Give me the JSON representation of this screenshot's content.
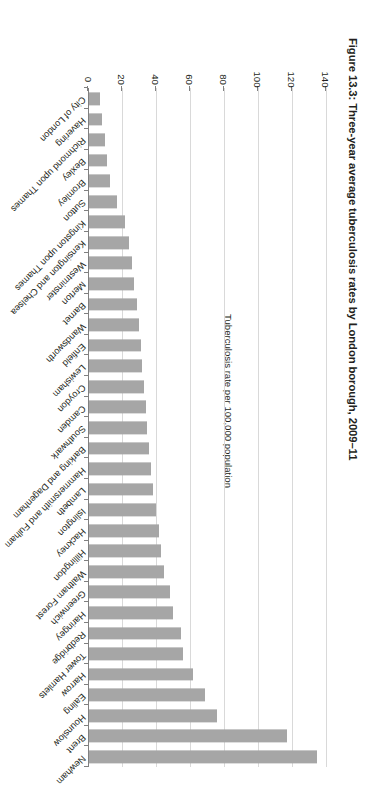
{
  "figure": {
    "caption": "Figure 13.3: Three-year average tuberculosis rates by London borough, 2009–11"
  },
  "colors": {
    "bar": "#a6a6a6",
    "gridline": "#d9d9d9",
    "axis": "#808080",
    "text": "#231f20",
    "background": "#ffffff"
  },
  "chart_data": {
    "type": "bar",
    "orientation": "vertical",
    "title": "Figure 13.3: Three-year average tuberculosis rates by London borough, 2009–11",
    "xlabel": "",
    "ylabel": "Tuberculosis rate per 100,000 population",
    "ylim": [
      0,
      140
    ],
    "yticks": [
      0,
      20,
      40,
      60,
      80,
      100,
      120,
      140
    ],
    "ytick_labels": [
      "0",
      "20",
      "40",
      "60",
      "80",
      "100",
      "120",
      "140"
    ],
    "grid": true,
    "legend": false,
    "series_name": "Three-year average tuberculosis rate",
    "categories": [
      "Newham",
      "Brent",
      "Hounslow",
      "Ealing",
      "Harrow",
      "Tower Hamlets",
      "Redbridge",
      "Haringey",
      "Greenwich",
      "Waltham Forest",
      "Hillingdon",
      "Hackney",
      "Islington",
      "Lambeth",
      "Hammersmith and Fulham",
      "Barking and Dagenham",
      "Southwark",
      "Camden",
      "Croydon",
      "Lewisham",
      "Enfield",
      "Wandsworth",
      "Barnet",
      "Merton",
      "Westminster",
      "Kensington and Chelsea",
      "Kingston upon Thames",
      "Sutton",
      "Bromley",
      "Bexley",
      "Richmond upon Thames",
      "Havering",
      "City of London"
    ],
    "values": [
      135,
      117,
      76,
      69,
      62,
      56,
      55,
      50,
      48,
      45,
      43,
      42,
      40,
      38,
      37,
      36,
      35,
      34,
      33,
      32,
      31,
      30,
      29,
      27,
      26,
      24,
      22,
      17,
      13,
      11,
      10,
      8,
      7
    ]
  }
}
